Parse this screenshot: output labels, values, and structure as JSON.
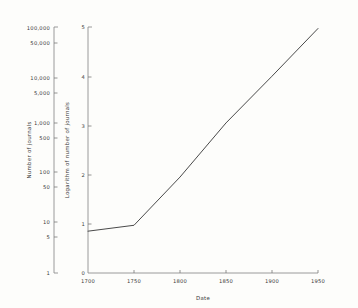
{
  "chart_data": {
    "type": "line",
    "title": "",
    "xlabel": "Date",
    "ylabel": "Number of journals",
    "y2label": "Logarithm of number of journals",
    "grid": false,
    "legend": "none",
    "x": [
      1700,
      1750,
      1800,
      1850,
      1900,
      1950
    ],
    "values_log": [
      0.85,
      0.97,
      1.95,
      3.05,
      4.0,
      4.97
    ],
    "values_count": [
      7,
      10,
      100,
      1000,
      10000,
      100000
    ],
    "xlim": [
      1700,
      1950
    ],
    "ylim_log": [
      0,
      5
    ],
    "xticks": [
      "1700",
      "1750",
      "1800",
      "1850",
      "1900",
      "1950"
    ],
    "yticks_log": [
      "0",
      "1",
      "2",
      "3",
      "4",
      "5"
    ],
    "yticks_count": [
      "1",
      "5",
      "10",
      "50",
      "100",
      "500",
      "1,000",
      "5,000",
      "10,000",
      "50,000",
      "100,000"
    ],
    "line_color": "#4a4a4a",
    "axis_color": "#8e8e8e",
    "background": "#fdfdfb"
  },
  "axes": {
    "left": {
      "label": "Number of journals",
      "ticks": [
        {
          "text": "100,000",
          "y": 28
        },
        {
          "text": "50,000",
          "y": 43
        },
        {
          "text": "10,000",
          "y": 78
        },
        {
          "text": "5,000",
          "y": 93
        },
        {
          "text": "1,000",
          "y": 123
        },
        {
          "text": "500",
          "y": 138
        },
        {
          "text": "100",
          "y": 172
        },
        {
          "text": "50",
          "y": 187
        },
        {
          "text": "10",
          "y": 222
        },
        {
          "text": "5",
          "y": 237
        },
        {
          "text": "1",
          "y": 272
        }
      ]
    },
    "inner": {
      "label": "Logarithm of number of journals",
      "ticks": [
        {
          "text": "5",
          "y": 28
        },
        {
          "text": "4",
          "y": 77
        },
        {
          "text": "3",
          "y": 126
        },
        {
          "text": "2",
          "y": 175
        },
        {
          "text": "1",
          "y": 224
        },
        {
          "text": "0",
          "y": 273
        }
      ]
    },
    "bottom": {
      "label": "Date",
      "ticks": [
        {
          "text": "1700",
          "x": 88
        },
        {
          "text": "1750",
          "x": 134
        },
        {
          "text": "1800",
          "x": 180
        },
        {
          "text": "1850",
          "x": 226
        },
        {
          "text": "1900",
          "x": 272
        },
        {
          "text": "1950",
          "x": 318
        }
      ]
    }
  }
}
